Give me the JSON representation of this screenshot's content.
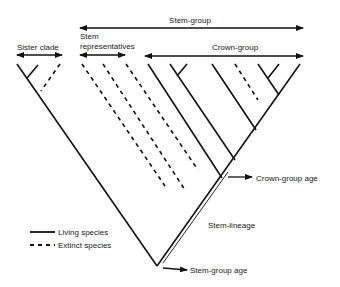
{
  "labels": {
    "stem_group": "Stem-group",
    "sister_clade": "Sister clade",
    "stem_representatives_1": "Stem",
    "stem_representatives_2": "representatives",
    "crown_group": "Crown-group",
    "crown_group_age": "Crown-group age",
    "stem_lineage": "Stem-lineage",
    "stem_group_age": "Stem-group age"
  },
  "legend": {
    "living": "Living species",
    "extinct": "Extinct species"
  },
  "colors": {
    "line": "#111111",
    "text": "#222222",
    "background": "#ffffff"
  }
}
